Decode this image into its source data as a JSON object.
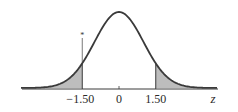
{
  "chart_data": {
    "type": "area",
    "title": "",
    "xlabel": "z",
    "ylabel": "",
    "xlim": [
      -4,
      4
    ],
    "grid": false,
    "legend": null,
    "distribution": {
      "name": "standard normal",
      "mean": 0,
      "sd": 1
    },
    "shaded_regions": [
      {
        "from": "-inf",
        "to": -1.5,
        "label": "left tail"
      },
      {
        "from": 1.5,
        "to": "inf",
        "label": "right tail"
      }
    ],
    "x_ticks": [
      {
        "value": -1.5,
        "label": "−1.50"
      },
      {
        "value": 0,
        "label": "0"
      },
      {
        "value": 1.5,
        "label": "1.50"
      }
    ],
    "annotations": [
      {
        "x": -1.5,
        "text": "*",
        "note": "small asterisk marker above the -1.50 boundary line"
      }
    ],
    "colors": {
      "curve": "#3a3a3a",
      "shade": "#bdbdbd",
      "axis": "#3a3a3a"
    }
  },
  "labels": {
    "tick_neg": "−1.50",
    "tick_zero": "0",
    "tick_pos": "1.50",
    "axis_var": "z",
    "marker": "*"
  }
}
